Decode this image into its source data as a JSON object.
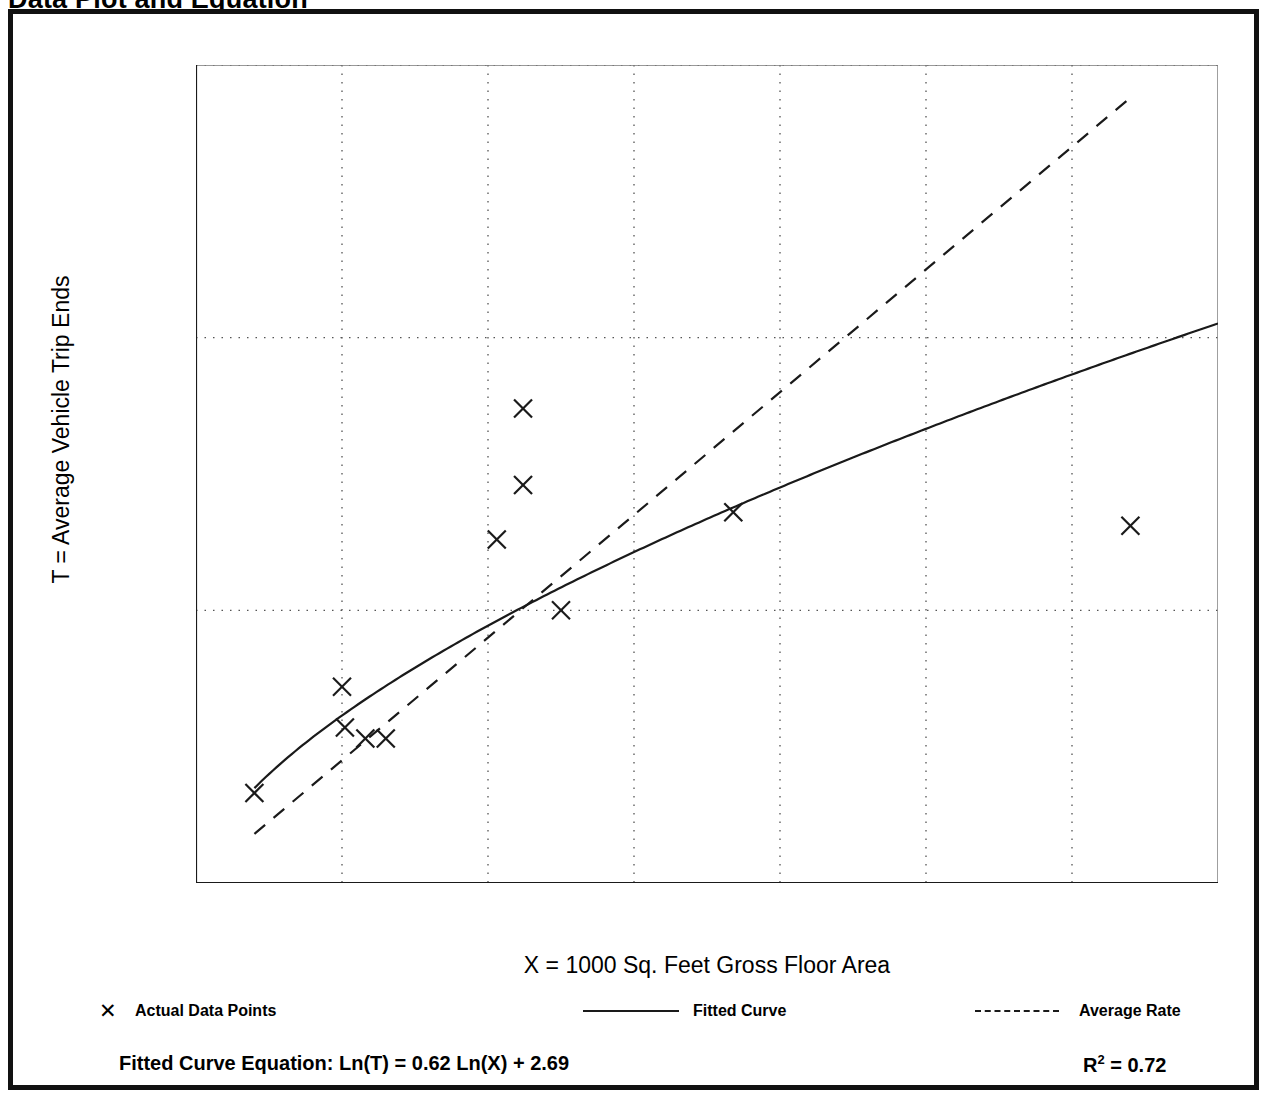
{
  "page": {
    "title": "Data Plot and Equation"
  },
  "chart_data": {
    "type": "scatter",
    "title": "Data Plot and Equation",
    "xlabel": "X = 1000 Sq. Feet Gross Floor Area",
    "ylabel": "T = Average Vehicle Trip Ends",
    "xlim": [
      0,
      70
    ],
    "ylim": [
      0,
      300
    ],
    "xticks": [
      0,
      10,
      20,
      30,
      40,
      50,
      60,
      70
    ],
    "yticks": [
      0,
      100,
      200,
      300
    ],
    "x_minor_tick_step": 5,
    "y_minor_tick_step": 50,
    "grid": "dotted gridlines at major x and y ticks",
    "legend_position": "below-plot",
    "series": [
      {
        "name": "Actual Data Points",
        "type": "scatter",
        "marker": "x",
        "points": [
          {
            "x": 4.0,
            "y": 33
          },
          {
            "x": 10.0,
            "y": 72
          },
          {
            "x": 10.2,
            "y": 57
          },
          {
            "x": 11.6,
            "y": 53
          },
          {
            "x": 13.0,
            "y": 53
          },
          {
            "x": 20.6,
            "y": 126
          },
          {
            "x": 22.4,
            "y": 174
          },
          {
            "x": 22.4,
            "y": 146
          },
          {
            "x": 25.0,
            "y": 100
          },
          {
            "x": 36.8,
            "y": 136
          },
          {
            "x": 64.0,
            "y": 131
          }
        ]
      },
      {
        "name": "Fitted Curve",
        "type": "line",
        "style": "solid",
        "equation": "Ln(T) = 0.62 Ln(X) + 2.69",
        "intercept": 2.69,
        "slope": 0.62,
        "r_squared": 0.72
      },
      {
        "name": "Average Rate",
        "type": "line",
        "style": "dashed",
        "rate_per_unit_x": 4.5,
        "x_range": [
          4,
          64
        ]
      }
    ]
  },
  "legend": {
    "items": [
      {
        "label": "Actual Data Points",
        "swatch": "marker-x"
      },
      {
        "label": "Fitted Curve",
        "swatch": "solid-line"
      },
      {
        "label": "Average Rate",
        "swatch": "dashed-line"
      }
    ]
  },
  "equation": {
    "text": "Fitted Curve Equation:  Ln(T) = 0.62 Ln(X) + 2.69",
    "r_squared_label": "R",
    "r_squared_exponent": "2",
    "r_squared_value": " = 0.72"
  },
  "colors": {
    "frame": "#111111",
    "ink": "#1a1a1a",
    "grid": "#555555",
    "background": "#ffffff"
  }
}
